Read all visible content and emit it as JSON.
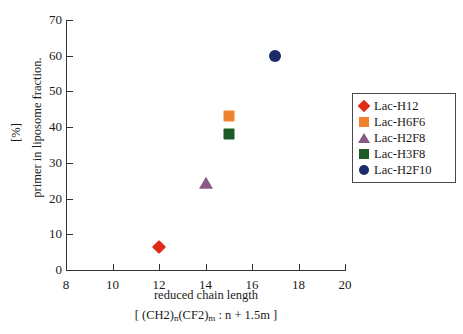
{
  "chart_data": {
    "type": "scatter",
    "title": "",
    "xlabel": "reduced chain length",
    "xlabel_sub": "[ (CH2)n(CF2)m : n + 1.5m ]",
    "ylabel": "primer in liposome fraction.",
    "yunit": "[%]",
    "xlim": [
      8,
      20
    ],
    "ylim": [
      0,
      70
    ],
    "xticks": [
      8,
      10,
      12,
      14,
      16,
      18,
      20
    ],
    "yticks": [
      0,
      10,
      20,
      30,
      40,
      50,
      60,
      70
    ],
    "grid": false,
    "legend_position": "right",
    "series": [
      {
        "name": "Lac-H12",
        "marker": "diamond",
        "color": "#E02B16",
        "x": [
          12
        ],
        "y": [
          6.5
        ]
      },
      {
        "name": "Lac-H6F6",
        "marker": "square",
        "color": "#F0812E",
        "x": [
          15
        ],
        "y": [
          43
        ]
      },
      {
        "name": "Lac-H2F8",
        "marker": "triangle",
        "color": "#8A5A84",
        "x": [
          14
        ],
        "y": [
          24
        ]
      },
      {
        "name": "Lac-H3F8",
        "marker": "square",
        "color": "#1D5A28",
        "x": [
          15
        ],
        "y": [
          38
        ]
      },
      {
        "name": "Lac-H2F10",
        "marker": "circle",
        "color": "#1A2A6B",
        "x": [
          17
        ],
        "y": [
          60
        ]
      }
    ]
  },
  "axis": {
    "y_tick_labels": [
      "0",
      "10",
      "20",
      "30",
      "40",
      "50",
      "60",
      "70"
    ],
    "x_tick_labels": [
      "8",
      "10",
      "12",
      "14",
      "16",
      "18",
      "20"
    ]
  },
  "legend": {
    "entries": [
      {
        "label": "Lac-H12"
      },
      {
        "label": "Lac-H6F6"
      },
      {
        "label": "Lac-H2F8"
      },
      {
        "label": "Lac-H3F8"
      },
      {
        "label": "Lac-H2F10"
      }
    ]
  }
}
